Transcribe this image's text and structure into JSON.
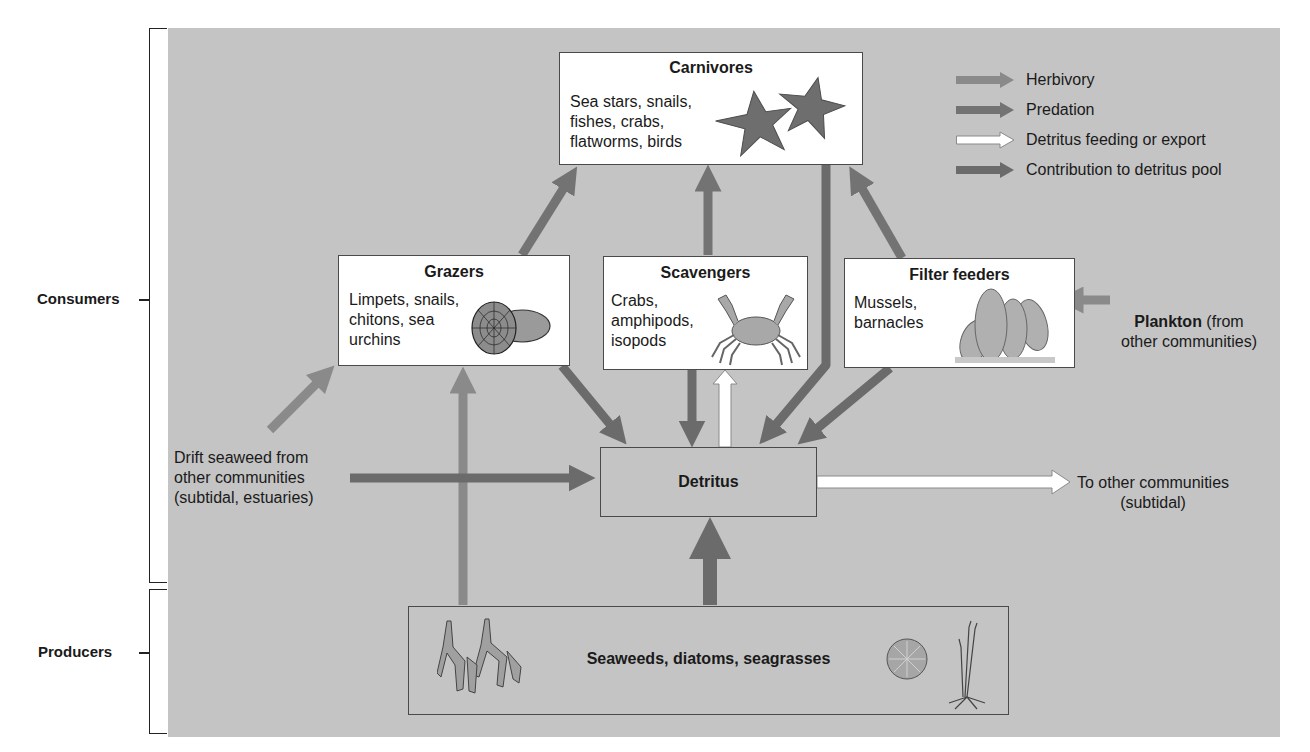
{
  "legend": [
    {
      "label": "Herbivory",
      "arrow_color": "#8a8a8a",
      "outline": "#8a8a8a"
    },
    {
      "label": "Predation",
      "arrow_color": "#737373",
      "outline": "#737373"
    },
    {
      "label": "Detritus feeding or export",
      "arrow_color": "#ffffff",
      "outline": "#8a8a8a"
    },
    {
      "label": "Contribution to detritus pool",
      "arrow_color": "#6b6b6b",
      "outline": "#6b6b6b"
    }
  ],
  "levels": {
    "consumers": "Consumers",
    "producers": "Producers"
  },
  "boxes": {
    "carnivores": {
      "title": "Carnivores",
      "body": "Sea stars, snails,\nfishes, crabs,\nflatworms, birds",
      "illustration": "sea-stars"
    },
    "grazers": {
      "title": "Grazers",
      "body": "Limpets, snails,\nchitons, sea\nurchins",
      "illustration": "limpet-shells"
    },
    "scavengers": {
      "title": "Scavengers",
      "body": "Crabs,\namphipods,\nisopods",
      "illustration": "crab"
    },
    "filter_feeders": {
      "title": "Filter feeders",
      "body": "Mussels,\nbarnacles",
      "illustration": "mussels"
    },
    "detritus": {
      "title": "Detritus"
    },
    "producers": {
      "title": "Seaweeds, diatoms, seagrasses",
      "illustrations": [
        "seaweed",
        "diatom",
        "seagrass"
      ]
    }
  },
  "external_sources": {
    "plankton": {
      "bold": "Plankton",
      "rest": " (from\nother communities)"
    },
    "drift_seaweed": "Drift seaweed from\nother communities\n(subtidal, estuaries)",
    "export": "To other communities\n(subtidal)"
  },
  "colors": {
    "panel": "#c4c4c4",
    "herbivory": "#8a8a8a",
    "predation": "#737373",
    "detritus_feeding": "#ffffff",
    "contribution": "#6b6b6b"
  }
}
